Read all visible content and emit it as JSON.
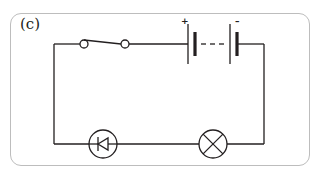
{
  "figure": {
    "panel_label": "(c)"
  },
  "colors": {
    "wire": "#231f20",
    "frame_border": "#bdbdbd",
    "background": "#ffffff"
  },
  "components": [
    {
      "id": "switch",
      "type": "switch",
      "state": "open"
    },
    {
      "id": "battery",
      "type": "battery",
      "cells": 2,
      "connection": "multi-cell (dashed)"
    },
    {
      "id": "diode",
      "type": "diode",
      "symbol": "diode-in-circle"
    },
    {
      "id": "lamp",
      "type": "lamp",
      "symbol": "circle-with-cross"
    }
  ],
  "battery": {
    "positive_label": "+",
    "negative_label": "–"
  }
}
